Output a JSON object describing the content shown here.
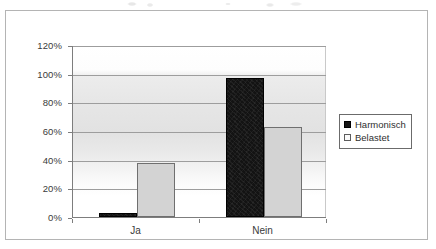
{
  "chart_data": {
    "type": "bar",
    "title": "",
    "xlabel": "",
    "ylabel": "",
    "categories": [
      "Ja",
      "Nein"
    ],
    "series": [
      {
        "name": "Harmonisch",
        "color": "#131313",
        "values": [
          3,
          97
        ]
      },
      {
        "name": "Belastet",
        "color": "#d3d3d3",
        "values": [
          38,
          63
        ]
      }
    ],
    "ylim": [
      0,
      120
    ],
    "ytick_values": [
      0,
      20,
      40,
      60,
      80,
      100,
      120
    ],
    "ytick_labels": [
      "0%",
      "20%",
      "40%",
      "60%",
      "80%",
      "100%",
      "120%"
    ],
    "ytick_suffix": "%",
    "grid": true,
    "grid_axis": "y",
    "legend_position": "right",
    "value_format": "percent"
  },
  "legend": {
    "entries": [
      {
        "label": "Harmonisch",
        "swatch": "dark"
      },
      {
        "label": "Belastet",
        "swatch": "light"
      }
    ]
  },
  "axes": {
    "y": {
      "labels": [
        "120%",
        "100%",
        "80%",
        "60%",
        "40%",
        "20%",
        "0%"
      ]
    },
    "x": {
      "labels": [
        "Ja",
        "Nein"
      ]
    }
  }
}
